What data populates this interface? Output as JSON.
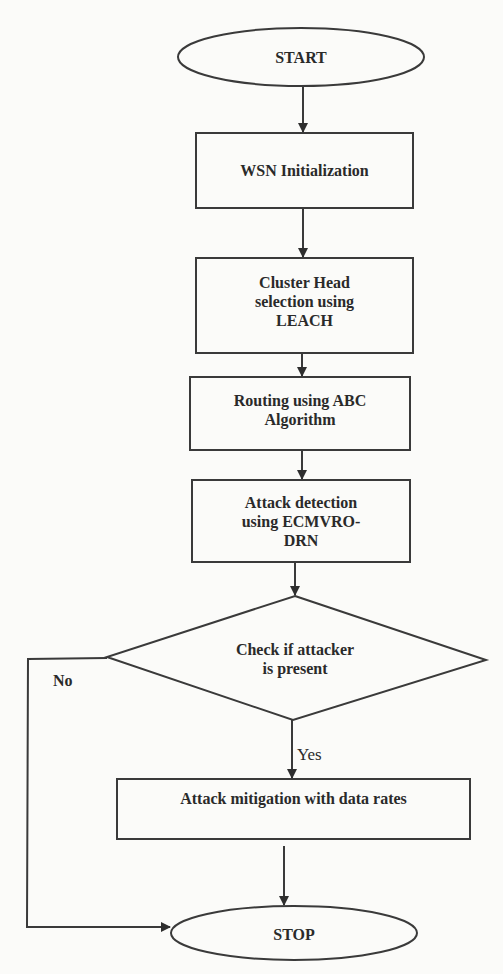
{
  "diagram": {
    "type": "flowchart",
    "colors": {
      "background": "#fbfbf9",
      "stroke": "#3a3a3a",
      "text": "#2a2a2a"
    },
    "nodes": [
      {
        "id": "start",
        "shape": "ellipse",
        "label": "START"
      },
      {
        "id": "wsn_init",
        "shape": "rect",
        "label": "WSN Initialization"
      },
      {
        "id": "cluster_head",
        "shape": "rect",
        "label": "Cluster Head selection using LEACH"
      },
      {
        "id": "routing",
        "shape": "rect",
        "label": "Routing using ABC Algorithm"
      },
      {
        "id": "attack_detection",
        "shape": "rect",
        "label": "Attack detection using ECMVRO-DRN"
      },
      {
        "id": "check_attacker",
        "shape": "diamond",
        "label": "Check if attacker is present"
      },
      {
        "id": "mitigation",
        "shape": "rect",
        "label": "Attack mitigation with data rates"
      },
      {
        "id": "stop",
        "shape": "ellipse",
        "label": "STOP"
      }
    ],
    "edges": [
      {
        "from": "start",
        "to": "wsn_init",
        "label": ""
      },
      {
        "from": "wsn_init",
        "to": "cluster_head",
        "label": ""
      },
      {
        "from": "cluster_head",
        "to": "routing",
        "label": ""
      },
      {
        "from": "routing",
        "to": "attack_detection",
        "label": ""
      },
      {
        "from": "attack_detection",
        "to": "check_attacker",
        "label": ""
      },
      {
        "from": "check_attacker",
        "to": "mitigation",
        "label": "Yes"
      },
      {
        "from": "check_attacker",
        "to": "stop",
        "label": "No"
      },
      {
        "from": "mitigation",
        "to": "stop",
        "label": ""
      }
    ]
  },
  "labels": {
    "start": "START",
    "wsn_init": "WSN Initialization",
    "cluster_head_l1": "Cluster Head",
    "cluster_head_l2": "selection using",
    "cluster_head_l3": "LEACH",
    "routing_l1": "Routing using ABC",
    "routing_l2": "Algorithm",
    "attack_l1": "Attack detection",
    "attack_l2": "using ECMVRO-",
    "attack_l3": "DRN",
    "check_l1": "Check if attacker",
    "check_l2": "is present",
    "mitigation": "Attack mitigation with data rates",
    "stop": "STOP",
    "edge_yes": "Yes",
    "edge_no": "No"
  }
}
